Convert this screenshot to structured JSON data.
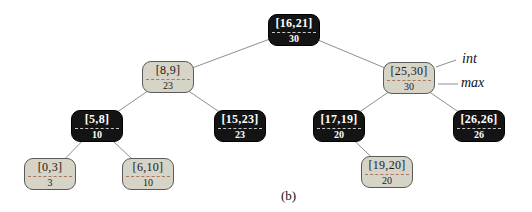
{
  "figure": {
    "type": "interval-tree-diagram",
    "caption": "(b)"
  },
  "colors": {
    "background": "#ffffff",
    "black_node_fill": "#141414",
    "black_node_text": "#ffffff",
    "black_node_divider": "#c8c8c8",
    "light_node_fill": "#d6d3c7",
    "light_node_border": "#5a5a5a",
    "light_node_text": "#1a1a1a",
    "light_node_divider": "#a8755e",
    "edge": "#8f8f8f"
  },
  "annotations": [
    {
      "name": "int-label",
      "text": "int",
      "x": 462,
      "y": 52,
      "line": {
        "x1": 436,
        "y1": 67,
        "x2": 456,
        "y2": 60
      }
    },
    {
      "name": "max-label",
      "text": "max",
      "x": 461,
      "y": 76,
      "line": {
        "x1": 438,
        "y1": 84,
        "x2": 458,
        "y2": 84
      }
    }
  ],
  "tree": {
    "nodes": [
      {
        "id": "16-21",
        "interval": "[16,21]",
        "max": "30",
        "variant": "black",
        "cx": 294,
        "cy": 30
      },
      {
        "id": "8-9",
        "interval": "[8,9]",
        "max": "23",
        "variant": "light",
        "cx": 168,
        "cy": 77
      },
      {
        "id": "25-30",
        "interval": "[25,30]",
        "max": "30",
        "variant": "light",
        "cx": 409,
        "cy": 78
      },
      {
        "id": "5-8",
        "interval": "[5,8]",
        "max": "10",
        "variant": "black",
        "cx": 97,
        "cy": 126
      },
      {
        "id": "15-23",
        "interval": "[15,23]",
        "max": "23",
        "variant": "black",
        "cx": 240,
        "cy": 126
      },
      {
        "id": "17-19",
        "interval": "[17,19]",
        "max": "20",
        "variant": "black",
        "cx": 339,
        "cy": 126
      },
      {
        "id": "26-26",
        "interval": "[26,26]",
        "max": "26",
        "variant": "black",
        "cx": 479,
        "cy": 126
      },
      {
        "id": "0-3",
        "interval": "[0,3]",
        "max": "3",
        "variant": "light",
        "cx": 50,
        "cy": 174
      },
      {
        "id": "6-10",
        "interval": "[6,10]",
        "max": "10",
        "variant": "light",
        "cx": 148,
        "cy": 174
      },
      {
        "id": "19-20",
        "interval": "[19,20]",
        "max": "20",
        "variant": "light",
        "cx": 387,
        "cy": 172
      }
    ],
    "edges": [
      [
        "16-21",
        "8-9"
      ],
      [
        "16-21",
        "25-30"
      ],
      [
        "8-9",
        "5-8"
      ],
      [
        "8-9",
        "15-23"
      ],
      [
        "25-30",
        "17-19"
      ],
      [
        "25-30",
        "26-26"
      ],
      [
        "5-8",
        "0-3"
      ],
      [
        "5-8",
        "6-10"
      ],
      [
        "17-19",
        "19-20"
      ]
    ]
  }
}
